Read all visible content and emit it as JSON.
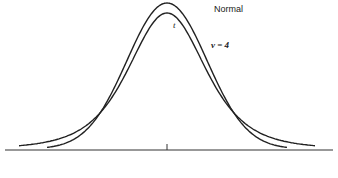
{
  "chart_data": {
    "type": "line",
    "title": "",
    "xlabel": "",
    "ylabel": "",
    "grid": false,
    "axes": {
      "x_axis_visible": true,
      "y_axis_visible": false,
      "center_tick": true
    },
    "series": [
      {
        "name": "Normal",
        "label": "Normal",
        "distribution": "standard normal",
        "x": [
          -4,
          -3.5,
          -3,
          -2.5,
          -2,
          -1.5,
          -1,
          -0.5,
          0,
          0.5,
          1,
          1.5,
          2,
          2.5,
          3,
          3.5,
          4
        ],
        "values": [
          0.0001,
          0.0009,
          0.0044,
          0.0175,
          0.054,
          0.1295,
          0.242,
          0.3521,
          0.3989,
          0.3521,
          0.242,
          0.1295,
          0.054,
          0.0175,
          0.0044,
          0.0009,
          0.0001
        ]
      },
      {
        "name": "t (ν = 4)",
        "label": "t",
        "annotation": "ν = 4",
        "distribution": "Student t, 4 degrees of freedom",
        "x": [
          -4,
          -3.5,
          -3,
          -2.5,
          -2,
          -1.5,
          -1,
          -0.5,
          0,
          0.5,
          1,
          1.5,
          2,
          2.5,
          3,
          3.5,
          4
        ],
        "values": [
          0.0066,
          0.0117,
          0.0197,
          0.035,
          0.0663,
          0.122,
          0.2147,
          0.3222,
          0.375,
          0.3222,
          0.2147,
          0.122,
          0.0663,
          0.035,
          0.0197,
          0.0117,
          0.0066
        ]
      }
    ],
    "annotations": [
      "Normal",
      "t",
      "ν = 4"
    ]
  },
  "labels": {
    "normal": "Normal",
    "t": "t",
    "nu": "ν = 4"
  }
}
